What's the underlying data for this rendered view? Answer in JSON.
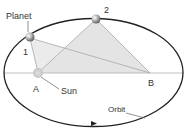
{
  "diagram": {
    "labels": {
      "planet": "Planet",
      "sun": "Sun",
      "orbit": "Orbit",
      "point_1": "1",
      "point_2": "2",
      "focus_a": "A",
      "focus_b": "B"
    },
    "colors": {
      "orbit": "#222222",
      "lines": "#a8a8a8",
      "shade": "#e6e6e6",
      "text": "#333333",
      "leader": "#666666"
    }
  }
}
